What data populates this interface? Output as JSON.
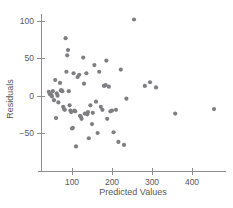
{
  "chart_data": {
    "type": "scatter",
    "title": "",
    "xlabel": "Predicted Values",
    "ylabel": "Residuals",
    "xticks": [
      100,
      200,
      300,
      400
    ],
    "yticks": [
      -50,
      0,
      50,
      100
    ],
    "xlim": [
      30,
      470
    ],
    "ylim": [
      -75,
      110
    ],
    "grid": false,
    "legend": null,
    "marker": {
      "shape": "circle",
      "color": "#7f7f82",
      "size": 2.1
    },
    "series": [
      {
        "name": "residuals",
        "points": [
          [
            42,
            5
          ],
          [
            45,
            2
          ],
          [
            48,
            1
          ],
          [
            50,
            -1
          ],
          [
            52,
            6
          ],
          [
            55,
            -6
          ],
          [
            58,
            21
          ],
          [
            60,
            -30
          ],
          [
            62,
            3
          ],
          [
            64,
            0
          ],
          [
            66,
            -9
          ],
          [
            70,
            17
          ],
          [
            72,
            7
          ],
          [
            74,
            7
          ],
          [
            76,
            6
          ],
          [
            78,
            -15
          ],
          [
            80,
            -18
          ],
          [
            82,
            -19
          ],
          [
            84,
            77
          ],
          [
            86,
            32
          ],
          [
            88,
            54
          ],
          [
            90,
            61
          ],
          [
            92,
            6
          ],
          [
            94,
            -13
          ],
          [
            96,
            -20
          ],
          [
            98,
            -22
          ],
          [
            100,
            -44
          ],
          [
            102,
            -43
          ],
          [
            104,
            30
          ],
          [
            106,
            -20
          ],
          [
            108,
            -21
          ],
          [
            110,
            -68
          ],
          [
            114,
            25
          ],
          [
            118,
            28
          ],
          [
            120,
            -27
          ],
          [
            122,
            -28
          ],
          [
            124,
            -31
          ],
          [
            128,
            51
          ],
          [
            130,
            16
          ],
          [
            132,
            -24
          ],
          [
            136,
            30
          ],
          [
            138,
            -25
          ],
          [
            140,
            -22
          ],
          [
            142,
            -57
          ],
          [
            146,
            -13
          ],
          [
            150,
            -38
          ],
          [
            152,
            -23
          ],
          [
            156,
            41
          ],
          [
            160,
            -8
          ],
          [
            164,
            -50
          ],
          [
            168,
            32
          ],
          [
            172,
            -15
          ],
          [
            176,
            -19
          ],
          [
            180,
            13
          ],
          [
            184,
            14
          ],
          [
            186,
            47
          ],
          [
            188,
            -31
          ],
          [
            192,
            12
          ],
          [
            196,
            -21
          ],
          [
            200,
            -20
          ],
          [
            204,
            -49
          ],
          [
            210,
            -19
          ],
          [
            216,
            -62
          ],
          [
            222,
            35
          ],
          [
            230,
            -66
          ],
          [
            236,
            -4
          ],
          [
            255,
            102
          ],
          [
            282,
            13
          ],
          [
            295,
            18
          ],
          [
            310,
            11
          ],
          [
            358,
            -24
          ],
          [
            455,
            -18
          ]
        ]
      }
    ]
  }
}
